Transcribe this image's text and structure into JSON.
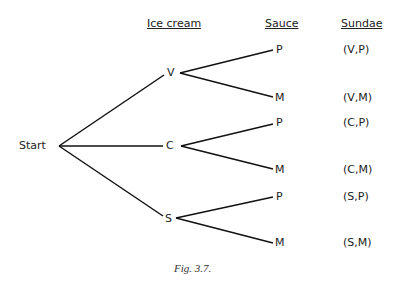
{
  "headers": {
    "ice_cream": "Ice cream",
    "sauce": "Sauce",
    "sundae": "Sundae"
  },
  "root": "Start",
  "level1": [
    "V",
    "C",
    "S"
  ],
  "level2": [
    "P",
    "M",
    "P",
    "M",
    "P",
    "M"
  ],
  "sundaes": [
    "(V,P)",
    "(V,M)",
    "(C,P)",
    "(C,M)",
    "(S,P)",
    "(S,M)"
  ],
  "caption": "Fig. 3.7."
}
